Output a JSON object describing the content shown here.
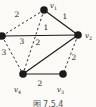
{
  "figure": {
    "type": "weighted-graph-diagram",
    "caption": "图 7.5.4",
    "colors": {
      "background": "#fbfaf7",
      "ink": "#1a1a1a",
      "text": "#222222"
    },
    "vertex_radius": 3.8,
    "vertices": [
      {
        "id": "v1",
        "label": "v1",
        "x": 44,
        "y": 10,
        "label_x": 50,
        "label_y": 8
      },
      {
        "id": "v2",
        "label": "v2",
        "x": 78,
        "y": 35,
        "label_x": 85,
        "label_y": 38
      },
      {
        "id": "v3",
        "label": "v3",
        "x": 63,
        "y": 74,
        "label_x": 57,
        "label_y": 92
      },
      {
        "id": "v4",
        "label": "v4",
        "x": 23,
        "y": 74,
        "label_x": 14,
        "label_y": 92
      },
      {
        "id": "v5",
        "label": "",
        "x": 2,
        "y": 36,
        "label_x": null,
        "label_y": null
      }
    ],
    "edges": [
      {
        "from": "v5",
        "to": "v1",
        "weight": "2",
        "style": "dashed",
        "label_x": 17,
        "label_y": 17
      },
      {
        "from": "v1",
        "to": "v2",
        "weight": "1",
        "style": "solid",
        "label_x": 65,
        "label_y": 19
      },
      {
        "from": "v5",
        "to": "v2",
        "weight": "1",
        "style": "solid",
        "label_x": 46,
        "label_y": 30
      },
      {
        "from": "v1",
        "to": "v4",
        "weight": "3",
        "style": "dashed",
        "label_x": 22,
        "label_y": 44
      },
      {
        "from": "v5",
        "to": "v4",
        "weight": "3",
        "style": "dashed",
        "label_x": 4,
        "label_y": 55
      },
      {
        "from": "v2",
        "to": "v4",
        "weight": "2",
        "style": "solid",
        "label_x": 38,
        "label_y": 45
      },
      {
        "from": "v2",
        "to": "v3",
        "weight": "2",
        "style": "dashed",
        "label_x": 74,
        "label_y": 60
      },
      {
        "from": "v4",
        "to": "v3",
        "weight": "2",
        "style": "solid",
        "label_x": 40,
        "label_y": 86
      }
    ]
  }
}
